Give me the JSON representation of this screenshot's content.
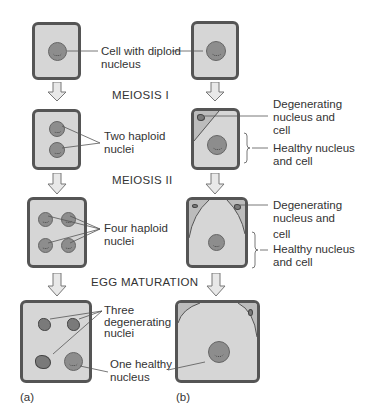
{
  "figure": {
    "stages": {
      "meiosis1": "MEIOSIS I",
      "meiosis2": "MEIOSIS II",
      "egg_maturation": "EGG MATURATION"
    },
    "panel_a": {
      "tag": "(a)",
      "labels": {
        "diploid_line1": "Cell with diploid",
        "diploid_line2": "nucleus",
        "two_haploid_line1": "Two haploid",
        "two_haploid_line2": "nuclei",
        "four_haploid_line1": "Four haploid",
        "four_haploid_line2": "nuclei",
        "three_degen_line1": "Three",
        "three_degen_line2": "degenerating",
        "three_degen_line3": "nuclei",
        "one_healthy_line1": "One healthy",
        "one_healthy_line2": "nucleus"
      }
    },
    "panel_b": {
      "tag": "(b)",
      "labels": {
        "degen1_line1": "Degenerating",
        "degen1_line2": "nucleus and",
        "degen1_line3": "cell",
        "healthy1_line1": "Healthy nucleus",
        "healthy1_line2": "and cell",
        "degen2_line1": "Degenerating",
        "degen2_line2": "nucleus and",
        "degen2_line3": "cell",
        "healthy2_line1": "Healthy nucleus",
        "healthy2_line2": "and cell"
      }
    },
    "colors": {
      "cell_fill": "#d6d6d6",
      "cell_border": "#555555",
      "nucleus_fill": "#8d8d8d",
      "arrow_fill": "#e8e8e8",
      "arrow_stroke": "#777777"
    }
  }
}
